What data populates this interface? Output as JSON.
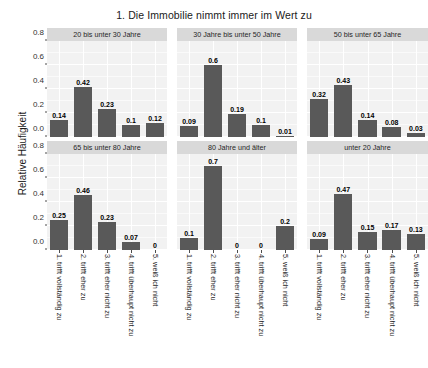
{
  "chart_data": {
    "type": "bar",
    "title": "1. Die Immobilie nimmt immer im Wert zu",
    "xlabel": "",
    "ylabel": "Relative Häufigkeit",
    "ylim": [
      0,
      0.8
    ],
    "grid": true,
    "legend": "none",
    "facet_layout": {
      "rows": 2,
      "cols": 3
    },
    "categories": [
      "1. trifft vollständig zu",
      "2. trifft eher zu",
      "3. trifft eher nicht zu",
      "4. trifft überhaupt nicht zu",
      "5. weiß ich nicht"
    ],
    "ytick_labels": [
      "0.0",
      "0.2",
      "0.4",
      "0.6",
      "0.8"
    ],
    "ytick_values": [
      0.0,
      0.2,
      0.4,
      0.6,
      0.8
    ],
    "panels": [
      {
        "title": "20 bis unter 30 Jahre",
        "values": [
          0.14,
          0.42,
          0.23,
          0.1,
          0.12
        ],
        "labels": [
          "0.14",
          "0.42",
          "0.23",
          "0.1",
          "0.12"
        ]
      },
      {
        "title": "30 Jahre bis unter 50 Jahre",
        "values": [
          0.09,
          0.6,
          0.19,
          0.1,
          0.01
        ],
        "labels": [
          "0.09",
          "0.6",
          "0.19",
          "0.1",
          "0.01"
        ]
      },
      {
        "title": "50 bis unter 65 Jahre",
        "values": [
          0.32,
          0.43,
          0.14,
          0.08,
          0.03
        ],
        "labels": [
          "0.32",
          "0.43",
          "0.14",
          "0.08",
          "0.03"
        ]
      },
      {
        "title": "65 bis unter 80 Jahre",
        "values": [
          0.25,
          0.46,
          0.23,
          0.07,
          0
        ],
        "labels": [
          "0.25",
          "0.46",
          "0.23",
          "0.07",
          "0"
        ]
      },
      {
        "title": "80 Jahre und älter",
        "values": [
          0.1,
          0.7,
          0,
          0,
          0.2
        ],
        "labels": [
          "0.1",
          "0.7",
          "0",
          "0",
          "0.2"
        ]
      },
      {
        "title": "unter 20 Jahre",
        "values": [
          0.09,
          0.47,
          0.15,
          0.17,
          0.13
        ],
        "labels": [
          "0.09",
          "0.47",
          "0.15",
          "0.17",
          "0.13"
        ]
      }
    ],
    "colors": {
      "bar": "#595959",
      "panel_background": "#f2f2f2",
      "strip_background": "#d9d9d9",
      "gridline": "#ffffff",
      "text": "#1a1a1a"
    }
  }
}
